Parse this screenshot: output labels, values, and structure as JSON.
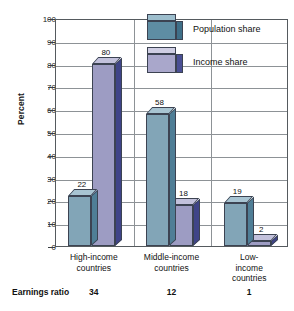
{
  "chart_data": {
    "type": "bar",
    "title": "",
    "xlabel": "",
    "ylabel": "Percent",
    "ylim": [
      0,
      100
    ],
    "ytick_step": 10,
    "yticks": [
      100,
      90,
      80,
      70,
      60,
      50,
      40,
      30,
      20,
      10,
      0
    ],
    "grid": true,
    "legend_position": "top-right",
    "categories": [
      "High-income countries",
      "Middle-income countries",
      "Low-income countries"
    ],
    "category_lines": [
      [
        "High-income",
        "countries"
      ],
      [
        "Middle-income",
        "countries"
      ],
      [
        "Low-income",
        "countries"
      ]
    ],
    "series": [
      {
        "name": "Population share",
        "color": "#82a5b7",
        "values": [
          22,
          58,
          19
        ]
      },
      {
        "name": "Income share",
        "color": "#9d9cc3",
        "values": [
          80,
          18,
          2
        ]
      }
    ],
    "footer": {
      "label": "Earnings ratio",
      "values": [
        34,
        12,
        1
      ]
    }
  },
  "colors": {
    "population_front": "#82a5b7",
    "population_side": "#4f7e96",
    "population_top": "#a8c4d2",
    "income_front": "#9d9cc3",
    "income_side": "#3f4488",
    "income_top": "#c2c1dc",
    "axis": "#555a5e",
    "grid": "#8d9296",
    "text": "#111111"
  }
}
